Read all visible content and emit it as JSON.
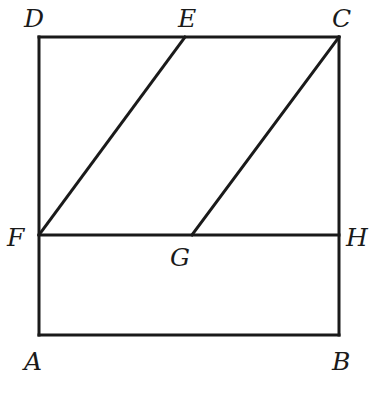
{
  "diagram": {
    "type": "geometry",
    "points": {
      "A": {
        "label": "A",
        "x": 39,
        "y": 335
      },
      "B": {
        "label": "B",
        "x": 339,
        "y": 335
      },
      "C": {
        "label": "C",
        "x": 339,
        "y": 37
      },
      "D": {
        "label": "D",
        "x": 39,
        "y": 37
      },
      "E": {
        "label": "E",
        "x": 185,
        "y": 37
      },
      "F": {
        "label": "F",
        "x": 39,
        "y": 235
      },
      "G": {
        "label": "G",
        "x": 192,
        "y": 235
      },
      "H": {
        "label": "H",
        "x": 339,
        "y": 235
      }
    },
    "segments": [
      [
        "A",
        "B"
      ],
      [
        "B",
        "C"
      ],
      [
        "C",
        "D"
      ],
      [
        "D",
        "A"
      ],
      [
        "F",
        "H"
      ],
      [
        "F",
        "E"
      ],
      [
        "G",
        "C"
      ]
    ],
    "labels": {
      "A": "A",
      "B": "B",
      "C": "C",
      "D": "D",
      "E": "E",
      "F": "F",
      "G": "G",
      "H": "H"
    },
    "line_color": "#1a1a1a"
  }
}
